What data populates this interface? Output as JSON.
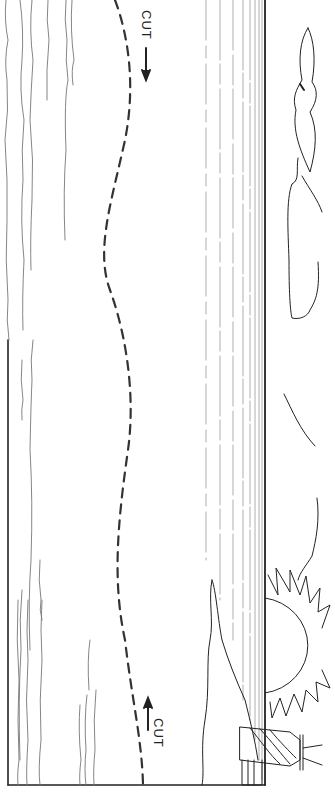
{
  "illustration": {
    "subject": "seascape cut-out template",
    "orientation": "rotated 90 degrees clockwise",
    "elements": [
      "sea-waves",
      "dashed-cut-line",
      "horizon-lines",
      "clouds",
      "seagull",
      "sun",
      "rocks",
      "lighthouse"
    ],
    "colors": {
      "line": "#222222",
      "background": "#ffffff",
      "light_line": "#888888"
    }
  },
  "labels": {
    "cut_top": "CUT",
    "cut_bottom": "CUT"
  }
}
